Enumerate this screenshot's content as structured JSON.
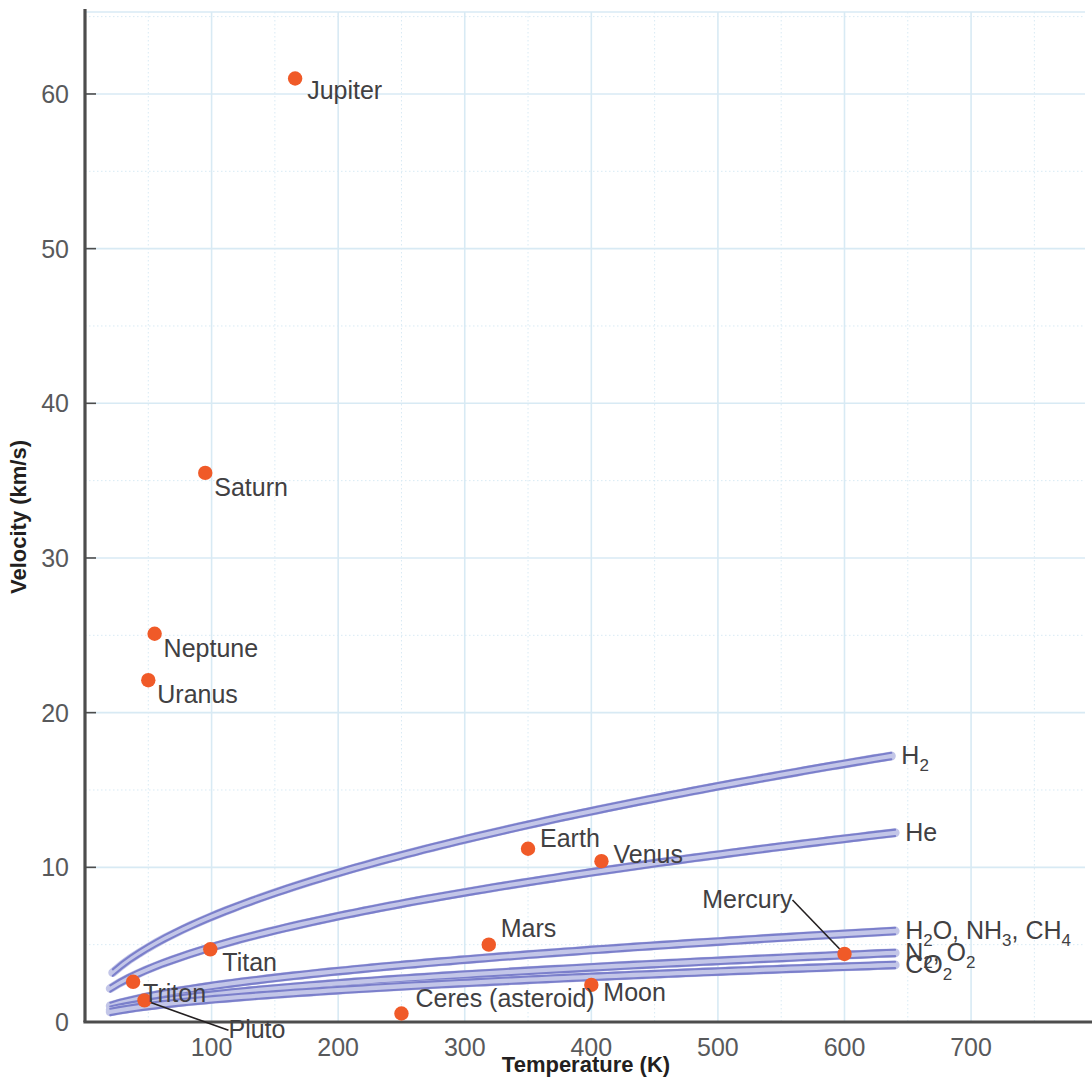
{
  "chart_data": {
    "type": "scatter",
    "title": "",
    "xlabel": "Temperature (K)",
    "ylabel": "Velocity (km/s)",
    "xlim": [
      0,
      790
    ],
    "ylim": [
      0,
      65
    ],
    "grid": true,
    "x_ticks": [
      100,
      200,
      300,
      400,
      500,
      600,
      700
    ],
    "x_tick_labels": [
      "100",
      "200",
      "300",
      "400",
      "500",
      "600",
      "700"
    ],
    "x_minor_ticks": [
      50,
      150,
      250,
      350,
      450,
      550,
      650,
      750
    ],
    "y_ticks": [
      0,
      10,
      20,
      30,
      40,
      50,
      60
    ],
    "y_tick_labels": [
      "0",
      "10",
      "20",
      "30",
      "40",
      "50",
      "60"
    ],
    "y_minor_ticks": [
      5,
      15,
      25,
      35,
      45,
      55,
      65
    ],
    "marker_color": "#F05A28",
    "curve_color": "#7B7FCB",
    "grid_color": "#D8EAF4",
    "axis_color": "#4D4D4D",
    "points": [
      {
        "name": "Jupiter",
        "x": 166,
        "y": 61.0,
        "label_dx": 12,
        "label_dy": 20,
        "anchor": "start",
        "leader": false
      },
      {
        "name": "Saturn",
        "x": 95,
        "y": 35.5,
        "label_dx": 9,
        "label_dy": 23,
        "anchor": "start",
        "leader": false
      },
      {
        "name": "Neptune",
        "x": 55,
        "y": 25.1,
        "label_dx": 9,
        "label_dy": 23,
        "anchor": "start",
        "leader": false
      },
      {
        "name": "Uranus",
        "x": 50,
        "y": 22.1,
        "label_dx": 9,
        "label_dy": 23,
        "anchor": "start",
        "leader": false
      },
      {
        "name": "Earth",
        "x": 350,
        "y": 11.2,
        "label_dx": 12,
        "label_dy": -2,
        "anchor": "start",
        "leader": false
      },
      {
        "name": "Venus",
        "x": 408,
        "y": 10.4,
        "label_dx": 12,
        "label_dy": 2,
        "anchor": "start",
        "leader": false
      },
      {
        "name": "Mars",
        "x": 319,
        "y": 5.0,
        "label_dx": 12,
        "label_dy": -8,
        "anchor": "start",
        "leader": false
      },
      {
        "name": "Mercury",
        "x": 600,
        "y": 4.4,
        "label_dx": -52,
        "label_dy": -46,
        "anchor": "end",
        "leader": true
      },
      {
        "name": "Titan",
        "x": 99,
        "y": 4.7,
        "label_dx": 12,
        "label_dy": 22,
        "anchor": "start",
        "leader": false
      },
      {
        "name": "Triton",
        "x": 38,
        "y": 2.6,
        "label_dx": 10,
        "label_dy": 20,
        "anchor": "start",
        "leader": false
      },
      {
        "name": "Moon",
        "x": 400,
        "y": 2.4,
        "label_dx": 12,
        "label_dy": 16,
        "anchor": "start",
        "leader": false
      },
      {
        "name": "Pluto",
        "x": 47,
        "y": 1.4,
        "label_dx": 84,
        "label_dy": 38,
        "anchor": "start",
        "leader": true
      },
      {
        "name": "Ceres (asteroid)",
        "x": 250,
        "y": 0.55,
        "label_dx": 14,
        "label_dy": -6,
        "anchor": "start",
        "leader": false
      }
    ],
    "curves": [
      {
        "name": "H2",
        "label": "H",
        "label_sub": "2",
        "label_tail": "",
        "molar_mass": 2.016,
        "t_start": 22,
        "t_end": 637,
        "label_x": 900,
        "label_y_offset": 3
      },
      {
        "name": "He",
        "label": "He",
        "label_sub": "",
        "label_tail": "",
        "molar_mass": 4.003,
        "t_start": 20,
        "t_end": 640,
        "label_x": 900,
        "label_y_offset": 3
      },
      {
        "name": "H2O, NH3, CH4",
        "label": "H",
        "label_sub": "2",
        "label_tail": "O, NH",
        "molar_mass": 17.3,
        "t_start": 20,
        "t_end": 640,
        "label_x": 900,
        "label_y_offset": 3
      },
      {
        "name": "N2, O2",
        "label": "N",
        "label_sub": "2",
        "label_tail": ", O",
        "molar_mass": 30.0,
        "t_start": 20,
        "t_end": 640,
        "label_x": 900,
        "label_y_offset": 3
      },
      {
        "name": "CO2",
        "label": "CO",
        "label_sub": "2",
        "label_tail": "",
        "molar_mass": 44.0,
        "t_start": 20,
        "t_end": 640,
        "label_x": 900,
        "label_y_offset": 3
      }
    ],
    "curve_labels": [
      {
        "id": "h2",
        "parts": [
          {
            "t": "H",
            "sub": false
          },
          {
            "t": "2",
            "sub": true
          }
        ]
      },
      {
        "id": "he",
        "parts": [
          {
            "t": "He",
            "sub": false
          }
        ]
      },
      {
        "id": "h2o",
        "parts": [
          {
            "t": "H",
            "sub": false
          },
          {
            "t": "2",
            "sub": true
          },
          {
            "t": "O, NH",
            "sub": false
          },
          {
            "t": "3",
            "sub": true
          },
          {
            "t": ", CH",
            "sub": false
          },
          {
            "t": "4",
            "sub": true
          }
        ]
      },
      {
        "id": "n2",
        "parts": [
          {
            "t": "N",
            "sub": false
          },
          {
            "t": "2",
            "sub": true
          },
          {
            "t": ", O",
            "sub": false
          },
          {
            "t": "2",
            "sub": true
          }
        ]
      },
      {
        "id": "co2",
        "parts": [
          {
            "t": "CO",
            "sub": false
          },
          {
            "t": "2",
            "sub": true
          }
        ]
      }
    ]
  }
}
